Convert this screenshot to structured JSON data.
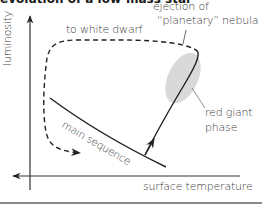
{
  "title": "evolution of a low-mass star",
  "axes": {
    "y_label": "luminosity",
    "x_label": "surface temperature"
  },
  "labels": {
    "to_white_dwarf": "to white dwarf",
    "ejection_line1": "ejection of",
    "ejection_line2": "“planetary” nebula",
    "red_giant_line1": "red giant",
    "red_giant_line2": "phase",
    "main_sequence": "main sequence"
  },
  "colors": {
    "line": "#222222",
    "nebula_fill": "#d9d9d9",
    "axis": "#333333",
    "rule": "#8a8a8a"
  }
}
